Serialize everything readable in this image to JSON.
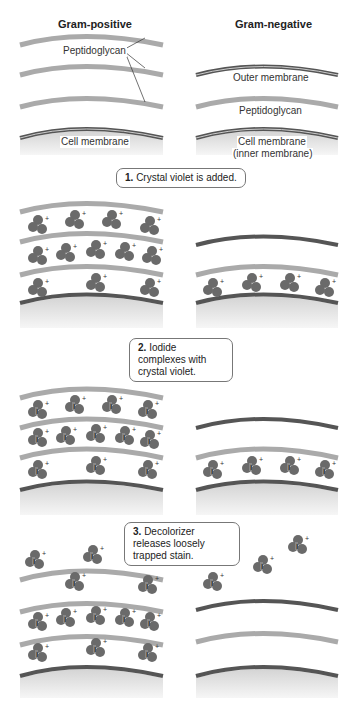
{
  "columns": {
    "left": "Gram-positive",
    "right": "Gram-negative"
  },
  "labels": {
    "peptidoglycan_left": "Peptidoglycan",
    "cell_membrane_left": "Cell membrane",
    "outer_membrane": "Outer membrane",
    "peptidoglycan_right": "Peptidoglycan",
    "cell_membrane_right": "Cell membrane",
    "inner_membrane": "(inner membrane)"
  },
  "steps": [
    {
      "num": "1.",
      "text": "Crystal violet is added."
    },
    {
      "num": "2.",
      "text": "Iodide complexes with crystal violet."
    },
    {
      "num": "3.",
      "text": "Decolorizer releases loosely trapped stain."
    }
  ],
  "colors": {
    "peptidoglycan": "#a8a8a8",
    "membrane": "#555555",
    "molecule": "#6e6e6e",
    "cytoplasm": "#e0e0e0"
  }
}
